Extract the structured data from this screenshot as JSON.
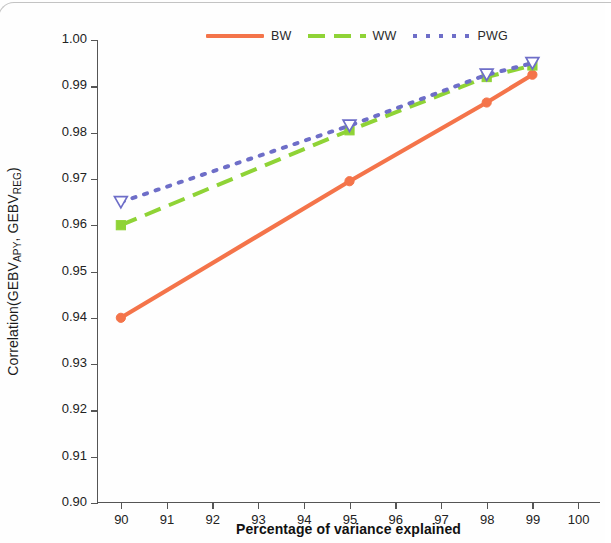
{
  "chart_data": {
    "type": "line",
    "title": "",
    "xlabel": "Percentage of variance explained",
    "ylabel": "Correlation(GEBV_APY, GEBV_REG)",
    "ylabel_parts": {
      "prefix": "Correlation(GEBV",
      "sub1": "APY",
      "mid": ", GEBV",
      "sub2": "REG",
      "suffix": ")"
    },
    "x": [
      90,
      95,
      98,
      99
    ],
    "xlim": [
      89.5,
      100.5
    ],
    "ylim": [
      0.9,
      1.0
    ],
    "xticks": [
      "90",
      "91",
      "92",
      "93",
      "94",
      "95",
      "96",
      "97",
      "98",
      "99",
      "100"
    ],
    "xtick_values": [
      90,
      91,
      92,
      93,
      94,
      95,
      96,
      97,
      98,
      99,
      100
    ],
    "yticks": [
      "0.90",
      "0.91",
      "0.92",
      "0.93",
      "0.94",
      "0.95",
      "0.96",
      "0.97",
      "0.98",
      "0.99",
      "1.00"
    ],
    "ytick_values": [
      0.9,
      0.91,
      0.92,
      0.93,
      0.94,
      0.95,
      0.96,
      0.97,
      0.98,
      0.99,
      1.0
    ],
    "grid": false,
    "legend_position": "top-center",
    "series": [
      {
        "name": "BW",
        "color": "#f4744a",
        "linestyle": "solid",
        "marker": "circle",
        "marker_fill": "filled",
        "values": [
          0.94,
          0.9695,
          0.9865,
          0.9925
        ]
      },
      {
        "name": "WW",
        "color": "#8fd336",
        "linestyle": "dashed",
        "marker": "square",
        "marker_fill": "filled",
        "values": [
          0.96,
          0.9805,
          0.992,
          0.9945
        ]
      },
      {
        "name": "PWG",
        "color": "#6e6ec8",
        "linestyle": "dotted",
        "marker": "triangle-down",
        "marker_fill": "open",
        "values": [
          0.965,
          0.9815,
          0.9925,
          0.995
        ]
      }
    ]
  },
  "legend": {
    "items": [
      {
        "label": "BW",
        "key": "solid-line-key"
      },
      {
        "label": "WW",
        "key": "dashed-line-key"
      },
      {
        "label": "PWG",
        "key": "dotted-line-key"
      }
    ]
  }
}
